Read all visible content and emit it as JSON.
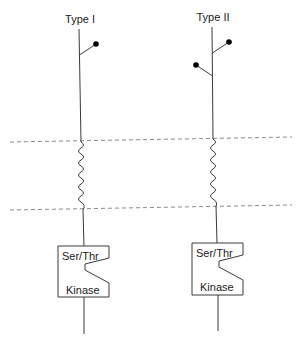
{
  "diagram": {
    "receptors": [
      {
        "label": "Type I",
        "ligand_sites": 1,
        "kinase": {
          "top_label": "Ser/Thr",
          "bottom_label": "Kinase"
        }
      },
      {
        "label": "Type II",
        "ligand_sites": 2,
        "kinase": {
          "top_label": "Ser/Thr",
          "bottom_label": "Kinase"
        }
      }
    ],
    "membrane": {
      "style": "dashed",
      "color": "#8a8a8a",
      "transmembrane_style": "wavy"
    },
    "colors": {
      "line": "#3a3a3a",
      "dot": "#000000",
      "background": "#ffffff"
    }
  }
}
